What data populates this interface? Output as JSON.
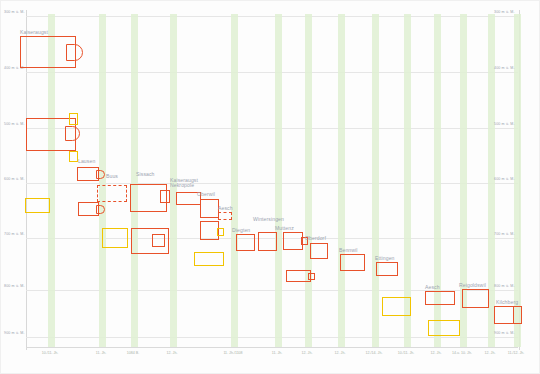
{
  "figure": {
    "type": "archaeological-plan-comparison"
  },
  "axes": {
    "y_unit": "m ü. M.",
    "y_ticks": [
      {
        "label": "300 m ü. M.",
        "y": 16
      },
      {
        "label": "400 m ü. M.",
        "y": 72
      },
      {
        "label": "500 m ü. M.",
        "y": 128
      },
      {
        "label": "600 m ü. M.",
        "y": 183
      },
      {
        "label": "700 m ü. M.",
        "y": 238
      },
      {
        "label": "800 m ü. M.",
        "y": 290
      },
      {
        "label": "900 m ü. M.",
        "y": 337
      }
    ],
    "x_ticks": [
      {
        "label": "10./11. Jh.",
        "x": 50
      },
      {
        "label": "11. Jh.",
        "x": 101
      },
      {
        "label": "1084 B.",
        "x": 133
      },
      {
        "label": "12. Jh.",
        "x": 172
      },
      {
        "label": "11. Jh./1108",
        "x": 233
      },
      {
        "label": "11. Jh.",
        "x": 277
      },
      {
        "label": "12. Jh.",
        "x": 307
      },
      {
        "label": "12. Jh.",
        "x": 340
      },
      {
        "label": "12./14. Jh.",
        "x": 374
      },
      {
        "label": "10./11. Jh.",
        "x": 406
      },
      {
        "label": "12. Jh.",
        "x": 436
      },
      {
        "label": "14.u. 10. Jh.",
        "x": 462
      },
      {
        "label": "12. Jh.",
        "x": 490
      },
      {
        "label": "11./12. Jh.",
        "x": 516
      }
    ],
    "bands_x": [
      48,
      99,
      131,
      170,
      231,
      275,
      305,
      338,
      372,
      404,
      434,
      460,
      488,
      514
    ]
  },
  "colors": {
    "red": "#e8522a",
    "orange": "#ef7b33",
    "yellow": "#f2c400",
    "band_green": "#dff0d2",
    "grid": "#e6e6e6",
    "label_text": "#9aa3b0"
  },
  "sites": [
    {
      "name": "Kaiseraugst",
      "label_x": 20,
      "label_y": 30
    },
    {
      "name": "Lausen",
      "label_x": 78,
      "label_y": 159
    },
    {
      "name": "Buus",
      "label_x": 106,
      "label_y": 174
    },
    {
      "name": "Sissach",
      "label_x": 136,
      "label_y": 172
    },
    {
      "name": "Kaiseraugst\nNekropole",
      "label_x": 170,
      "label_y": 178
    },
    {
      "name": "Oberwil",
      "label_x": 197,
      "label_y": 192
    },
    {
      "name": "Aesch",
      "label_x": 218,
      "label_y": 206
    },
    {
      "name": "Wintersingen",
      "label_x": 253,
      "label_y": 217
    },
    {
      "name": "Diegten",
      "label_x": 232,
      "label_y": 228
    },
    {
      "name": "Muttenz",
      "label_x": 275,
      "label_y": 226
    },
    {
      "name": "Oberdorf",
      "label_x": 305,
      "label_y": 236
    },
    {
      "name": "Bennwil",
      "label_x": 339,
      "label_y": 248
    },
    {
      "name": "Ettingen",
      "label_x": 375,
      "label_y": 256
    },
    {
      "name": "Aesch",
      "label_x": 425,
      "label_y": 285
    },
    {
      "name": "Reigoldswil",
      "label_x": 459,
      "label_y": 283
    },
    {
      "name": "Kilchberg",
      "label_x": 496,
      "label_y": 300
    }
  ],
  "plans": [
    {
      "id": "kaiseraugst-main",
      "style": "red",
      "x": 20,
      "y": 36,
      "w": 56,
      "h": 32
    },
    {
      "id": "kaiseraugst-apse",
      "style": "red",
      "x": 66,
      "y": 44,
      "w": 17,
      "h": 17
    },
    {
      "id": "lausen-large",
      "style": "red",
      "x": 26,
      "y": 118,
      "w": 50,
      "h": 33
    },
    {
      "id": "lausen-apse",
      "style": "red",
      "x": 65,
      "y": 126,
      "w": 15,
      "h": 15
    },
    {
      "id": "lausen-annexe-top",
      "style": "yellow",
      "x": 69,
      "y": 113,
      "w": 9,
      "h": 12
    },
    {
      "id": "lausen-annexe-bot",
      "style": "yellow",
      "x": 69,
      "y": 151,
      "w": 9,
      "h": 11
    },
    {
      "id": "buus-nave",
      "style": "red",
      "x": 77,
      "y": 167,
      "w": 22,
      "h": 14
    },
    {
      "id": "buus-apse",
      "style": "red",
      "x": 96,
      "y": 170,
      "w": 9,
      "h": 9
    },
    {
      "id": "buus-ghost",
      "style": "dashed",
      "x": 97,
      "y": 185,
      "w": 30,
      "h": 17
    },
    {
      "id": "sissach-nave",
      "style": "red",
      "x": 130,
      "y": 184,
      "w": 37,
      "h": 28
    },
    {
      "id": "sissach-choir",
      "style": "red",
      "x": 160,
      "y": 190,
      "w": 10,
      "h": 13
    },
    {
      "id": "kaiseraugst-nekro",
      "style": "red",
      "x": 176,
      "y": 192,
      "w": 25,
      "h": 13
    },
    {
      "id": "oberwil-upper",
      "style": "red",
      "x": 200,
      "y": 199,
      "w": 19,
      "h": 19
    },
    {
      "id": "oberwil-lower",
      "style": "red",
      "x": 200,
      "y": 221,
      "w": 19,
      "h": 19
    },
    {
      "id": "oberwil-annexe",
      "style": "yellow",
      "x": 217,
      "y": 228,
      "w": 7,
      "h": 8
    },
    {
      "id": "aesch-dashed",
      "style": "dashed",
      "x": 218,
      "y": 212,
      "w": 14,
      "h": 8
    },
    {
      "id": "second-yellow-large",
      "style": "yellow",
      "x": 25,
      "y": 198,
      "w": 25,
      "h": 15
    },
    {
      "id": "second-red-mid",
      "style": "red",
      "x": 78,
      "y": 202,
      "w": 21,
      "h": 14
    },
    {
      "id": "second-red-apse",
      "style": "red",
      "x": 96,
      "y": 205,
      "w": 9,
      "h": 9
    },
    {
      "id": "yellow-box-low",
      "style": "yellow",
      "x": 102,
      "y": 228,
      "w": 26,
      "h": 20
    },
    {
      "id": "big-red-low",
      "style": "red",
      "x": 131,
      "y": 228,
      "w": 38,
      "h": 26
    },
    {
      "id": "big-red-low-choir",
      "style": "red",
      "x": 152,
      "y": 234,
      "w": 13,
      "h": 13
    },
    {
      "id": "yellow-wide-low",
      "style": "yellow",
      "x": 194,
      "y": 252,
      "w": 30,
      "h": 14
    },
    {
      "id": "diegten",
      "style": "red",
      "x": 236,
      "y": 234,
      "w": 19,
      "h": 17
    },
    {
      "id": "wintersingen",
      "style": "red",
      "x": 258,
      "y": 232,
      "w": 19,
      "h": 19
    },
    {
      "id": "muttenz",
      "style": "red",
      "x": 283,
      "y": 232,
      "w": 20,
      "h": 18
    },
    {
      "id": "muttenz-annexe",
      "style": "red",
      "x": 301,
      "y": 237,
      "w": 7,
      "h": 8
    },
    {
      "id": "oberdorf",
      "style": "red",
      "x": 310,
      "y": 243,
      "w": 18,
      "h": 16
    },
    {
      "id": "bennwil",
      "style": "red",
      "x": 340,
      "y": 254,
      "w": 25,
      "h": 17
    },
    {
      "id": "ettingen",
      "style": "red",
      "x": 376,
      "y": 262,
      "w": 22,
      "h": 14
    },
    {
      "id": "low-red-strip",
      "style": "red",
      "x": 286,
      "y": 270,
      "w": 25,
      "h": 12
    },
    {
      "id": "low-red-strip-annexe",
      "style": "red",
      "x": 308,
      "y": 273,
      "w": 7,
      "h": 7
    },
    {
      "id": "yellow-mid-right",
      "style": "yellow",
      "x": 382,
      "y": 297,
      "w": 29,
      "h": 19
    },
    {
      "id": "aesch-right",
      "style": "red",
      "x": 425,
      "y": 291,
      "w": 30,
      "h": 14
    },
    {
      "id": "aesch-right-low",
      "style": "yellow",
      "x": 428,
      "y": 320,
      "w": 32,
      "h": 16
    },
    {
      "id": "reigoldswil",
      "style": "red",
      "x": 462,
      "y": 289,
      "w": 27,
      "h": 19
    },
    {
      "id": "kilchberg",
      "style": "red",
      "x": 494,
      "y": 306,
      "w": 28,
      "h": 18
    },
    {
      "id": "kilchberg-divider",
      "style": "red",
      "x": 513,
      "y": 306,
      "w": 9,
      "h": 18
    }
  ]
}
